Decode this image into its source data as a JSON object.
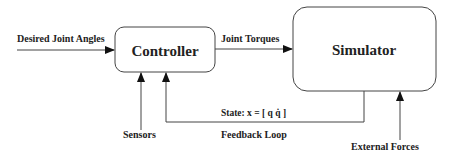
{
  "diagram": {
    "blocks": {
      "controller": {
        "label": "Controller"
      },
      "simulator": {
        "label": "Simulator"
      }
    },
    "edges": {
      "input": {
        "label": "Desired Joint Angles"
      },
      "torques": {
        "label": "Joint Torques"
      },
      "sensors": {
        "label": "Sensors"
      },
      "state": {
        "label": "State: x = [ q q̇ ]"
      },
      "feedback": {
        "label": "Feedback Loop"
      },
      "external": {
        "label": "External Forces"
      }
    },
    "colors": {
      "stroke": "#333333",
      "text": "#222222",
      "background": "#ffffff"
    }
  }
}
